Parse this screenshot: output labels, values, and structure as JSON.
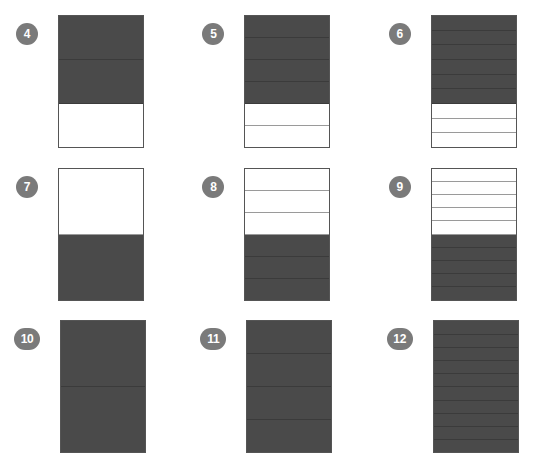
{
  "worksheet": {
    "title": "Fraction bar shading worksheet",
    "shaded_color": "#4a4a4a",
    "unshaded_color": "#ffffff",
    "outline_color": "#555555",
    "badge_color": "#7a7a7a",
    "badge_text_color": "#ffffff"
  },
  "items": [
    {
      "number": "4",
      "total_parts": 3,
      "shaded_parts": 2,
      "shaded_position": "top",
      "fraction": "2/3",
      "parts": [
        "shaded",
        "shaded",
        "unshaded"
      ]
    },
    {
      "number": "5",
      "total_parts": 6,
      "shaded_parts": 4,
      "shaded_position": "top",
      "fraction": "4/6",
      "parts": [
        "shaded",
        "shaded",
        "shaded",
        "shaded",
        "unshaded",
        "unshaded"
      ]
    },
    {
      "number": "6",
      "total_parts": 9,
      "shaded_parts": 6,
      "shaded_position": "top",
      "fraction": "6/9",
      "parts": [
        "shaded",
        "shaded",
        "shaded",
        "shaded",
        "shaded",
        "shaded",
        "unshaded",
        "unshaded",
        "unshaded"
      ]
    },
    {
      "number": "7",
      "total_parts": 2,
      "shaded_parts": 1,
      "shaded_position": "bottom",
      "fraction": "1/2",
      "parts": [
        "unshaded",
        "shaded"
      ]
    },
    {
      "number": "8",
      "total_parts": 6,
      "shaded_parts": 3,
      "shaded_position": "bottom",
      "fraction": "3/6",
      "parts": [
        "unshaded",
        "unshaded",
        "unshaded",
        "shaded",
        "shaded",
        "shaded"
      ]
    },
    {
      "number": "9",
      "total_parts": 10,
      "shaded_parts": 5,
      "shaded_position": "bottom",
      "fraction": "5/10",
      "parts": [
        "unshaded",
        "unshaded",
        "unshaded",
        "unshaded",
        "unshaded",
        "shaded",
        "shaded",
        "shaded",
        "shaded",
        "shaded"
      ]
    },
    {
      "number": "10",
      "total_parts": 2,
      "shaded_parts": 2,
      "shaded_position": "all",
      "fraction": "2/2",
      "parts": [
        "shaded",
        "shaded"
      ]
    },
    {
      "number": "11",
      "total_parts": 4,
      "shaded_parts": 4,
      "shaded_position": "all",
      "fraction": "4/4",
      "parts": [
        "shaded",
        "shaded",
        "shaded",
        "shaded"
      ]
    },
    {
      "number": "12",
      "total_parts": 10,
      "shaded_parts": 10,
      "shaded_position": "all",
      "fraction": "10/10",
      "parts": [
        "shaded",
        "shaded",
        "shaded",
        "shaded",
        "shaded",
        "shaded",
        "shaded",
        "shaded",
        "shaded",
        "shaded"
      ]
    }
  ]
}
